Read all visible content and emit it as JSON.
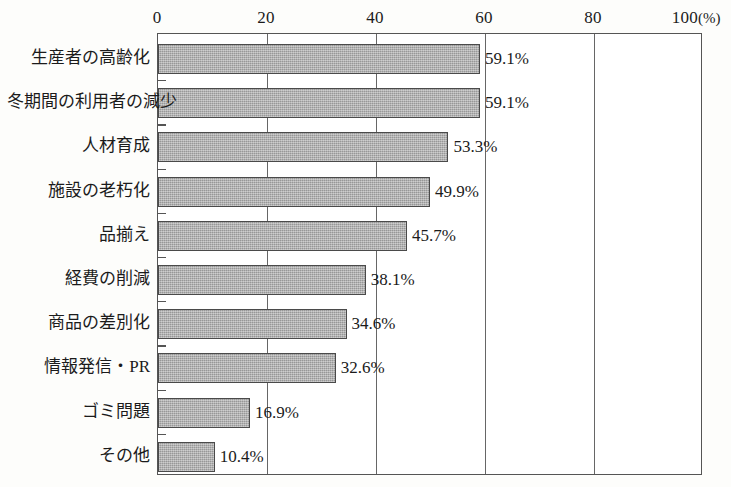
{
  "chart_data": {
    "type": "bar",
    "orientation": "horizontal",
    "title": "",
    "subtitle": "",
    "xlabel": "(%)",
    "ylabel": "",
    "xlim": [
      0,
      100
    ],
    "grid": true,
    "legend": null,
    "axis_position": "top",
    "tick_labels": [
      "0",
      "20",
      "40",
      "60",
      "80",
      "100"
    ],
    "ticks": [
      0,
      20,
      40,
      60,
      80,
      100
    ],
    "unit_suffix": "(%)",
    "categories": [
      "生産者の高齢化",
      "冬期間の利用者の減少",
      "人材育成",
      "施設の老朽化",
      "品揃え",
      "経費の削減",
      "商品の差別化",
      "情報発信・PR",
      "ゴミ問題",
      "その他"
    ],
    "values": [
      59.1,
      59.1,
      53.3,
      49.9,
      45.7,
      38.1,
      34.6,
      32.6,
      16.9,
      10.4
    ],
    "value_labels": [
      "59.1%",
      "59.1%",
      "53.3%",
      "49.9%",
      "45.7%",
      "38.1%",
      "34.6%",
      "32.6%",
      "16.9%",
      "10.4%"
    ]
  },
  "style": {
    "bar_fill": "#a9a9a9",
    "bar_border": "#4a4a4a",
    "frame_color": "#555555",
    "grid_color": "#666666",
    "text_color": "#1b1b1b",
    "background": "#fdfdfb"
  }
}
